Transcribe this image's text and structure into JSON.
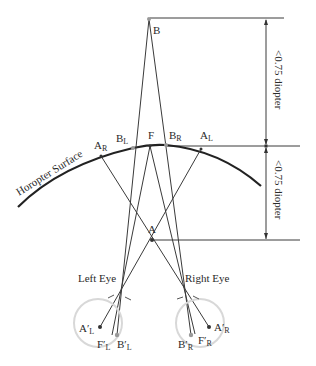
{
  "figure": {
    "top_caption_fragment": "",
    "horopter_label": "Horopter Surface",
    "points": {
      "B": {
        "label": "B",
        "sub": ""
      },
      "F": {
        "label": "F",
        "sub": ""
      },
      "A": {
        "label": "A",
        "sub": ""
      },
      "AR": {
        "label": "A",
        "sub": "R"
      },
      "BL": {
        "label": "B",
        "sub": "L"
      },
      "BR": {
        "label": "B",
        "sub": "R"
      },
      "AL": {
        "label": "A",
        "sub": "L"
      }
    },
    "retinal_points": {
      "ApL": {
        "label": "A′",
        "sub": "L"
      },
      "FpL": {
        "label": "F′",
        "sub": "L"
      },
      "BpL": {
        "label": "B′",
        "sub": "L"
      },
      "BpR": {
        "label": "B′",
        "sub": "R"
      },
      "FpR": {
        "label": "F′",
        "sub": "R"
      },
      "ApR": {
        "label": "A′",
        "sub": "R"
      }
    },
    "eyes": {
      "left": "Left Eye",
      "right": "Right Eye"
    },
    "dimensions": {
      "upper": "<0.75 diopter",
      "lower": "<0.75 diopter"
    },
    "colors": {
      "line": "#3a3a3a",
      "horopter": "#222222",
      "eye_outline": "#d8d8d8",
      "gray_point": "#999999"
    }
  }
}
